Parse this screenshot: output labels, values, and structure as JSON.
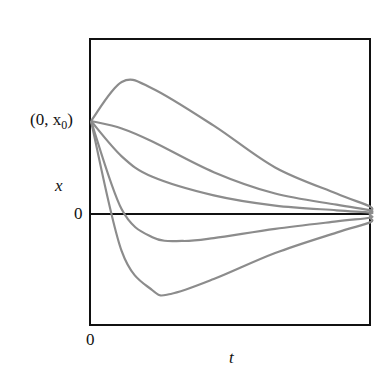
{
  "chart_data": {
    "type": "line",
    "title": "",
    "xlabel": "t",
    "ylabel": "x",
    "x_tick_labels": [
      "0"
    ],
    "y_tick_labels": [
      "0",
      "(0, x0)"
    ],
    "annotations": [
      "(0, x0)"
    ],
    "grid": false,
    "legend": null,
    "xlim": [
      0,
      10
    ],
    "ylim": [
      -1.2,
      1.8
    ],
    "series": [
      {
        "name": "curve-1 (overshoot up)",
        "points": [
          [
            0,
            1.0
          ],
          [
            0.5,
            1.42
          ],
          [
            1,
            1.35
          ],
          [
            2,
            0.95
          ],
          [
            3,
            0.5
          ],
          [
            4,
            0.22
          ],
          [
            5,
            0.08
          ],
          [
            6,
            0.03
          ],
          [
            8,
            0.0
          ],
          [
            10,
            0.0
          ]
        ]
      },
      {
        "name": "curve-2",
        "points": [
          [
            0,
            1.0
          ],
          [
            0.5,
            0.92
          ],
          [
            1,
            0.78
          ],
          [
            2,
            0.45
          ],
          [
            3,
            0.22
          ],
          [
            4,
            0.1
          ],
          [
            5,
            0.04
          ],
          [
            6,
            0.015
          ],
          [
            8,
            0.0
          ],
          [
            10,
            0.0
          ]
        ]
      },
      {
        "name": "curve-3",
        "points": [
          [
            0,
            1.0
          ],
          [
            0.5,
            0.62
          ],
          [
            1,
            0.4
          ],
          [
            2,
            0.2
          ],
          [
            3,
            0.09
          ],
          [
            4,
            0.04
          ],
          [
            5,
            0.015
          ],
          [
            6,
            0.005
          ],
          [
            8,
            0.0
          ],
          [
            10,
            0.0
          ]
        ]
      },
      {
        "name": "curve-4 (undershoot small)",
        "points": [
          [
            0,
            1.0
          ],
          [
            0.5,
            0.05
          ],
          [
            1,
            -0.25
          ],
          [
            1.5,
            -0.29
          ],
          [
            2,
            -0.26
          ],
          [
            3,
            -0.16
          ],
          [
            4,
            -0.08
          ],
          [
            5,
            -0.04
          ],
          [
            6,
            -0.015
          ],
          [
            8,
            0.0
          ],
          [
            10,
            0.0
          ]
        ]
      },
      {
        "name": "curve-5 (undershoot large)",
        "points": [
          [
            0,
            1.0
          ],
          [
            0.5,
            -0.4
          ],
          [
            1,
            -0.82
          ],
          [
            1.3,
            -0.86
          ],
          [
            2,
            -0.7
          ],
          [
            3,
            -0.42
          ],
          [
            4,
            -0.2
          ],
          [
            5,
            -0.09
          ],
          [
            6,
            -0.04
          ],
          [
            8,
            -0.005
          ],
          [
            10,
            0.0
          ]
        ]
      }
    ]
  },
  "labels": {
    "initial_point": "(0, x",
    "initial_point_sub": "0",
    "initial_point_close": ")",
    "y_axis": "x",
    "y_zero": "0",
    "x_zero": "0",
    "x_axis": "t"
  },
  "colors": {
    "curve": "#8c8c8c",
    "axis": "#111111"
  }
}
